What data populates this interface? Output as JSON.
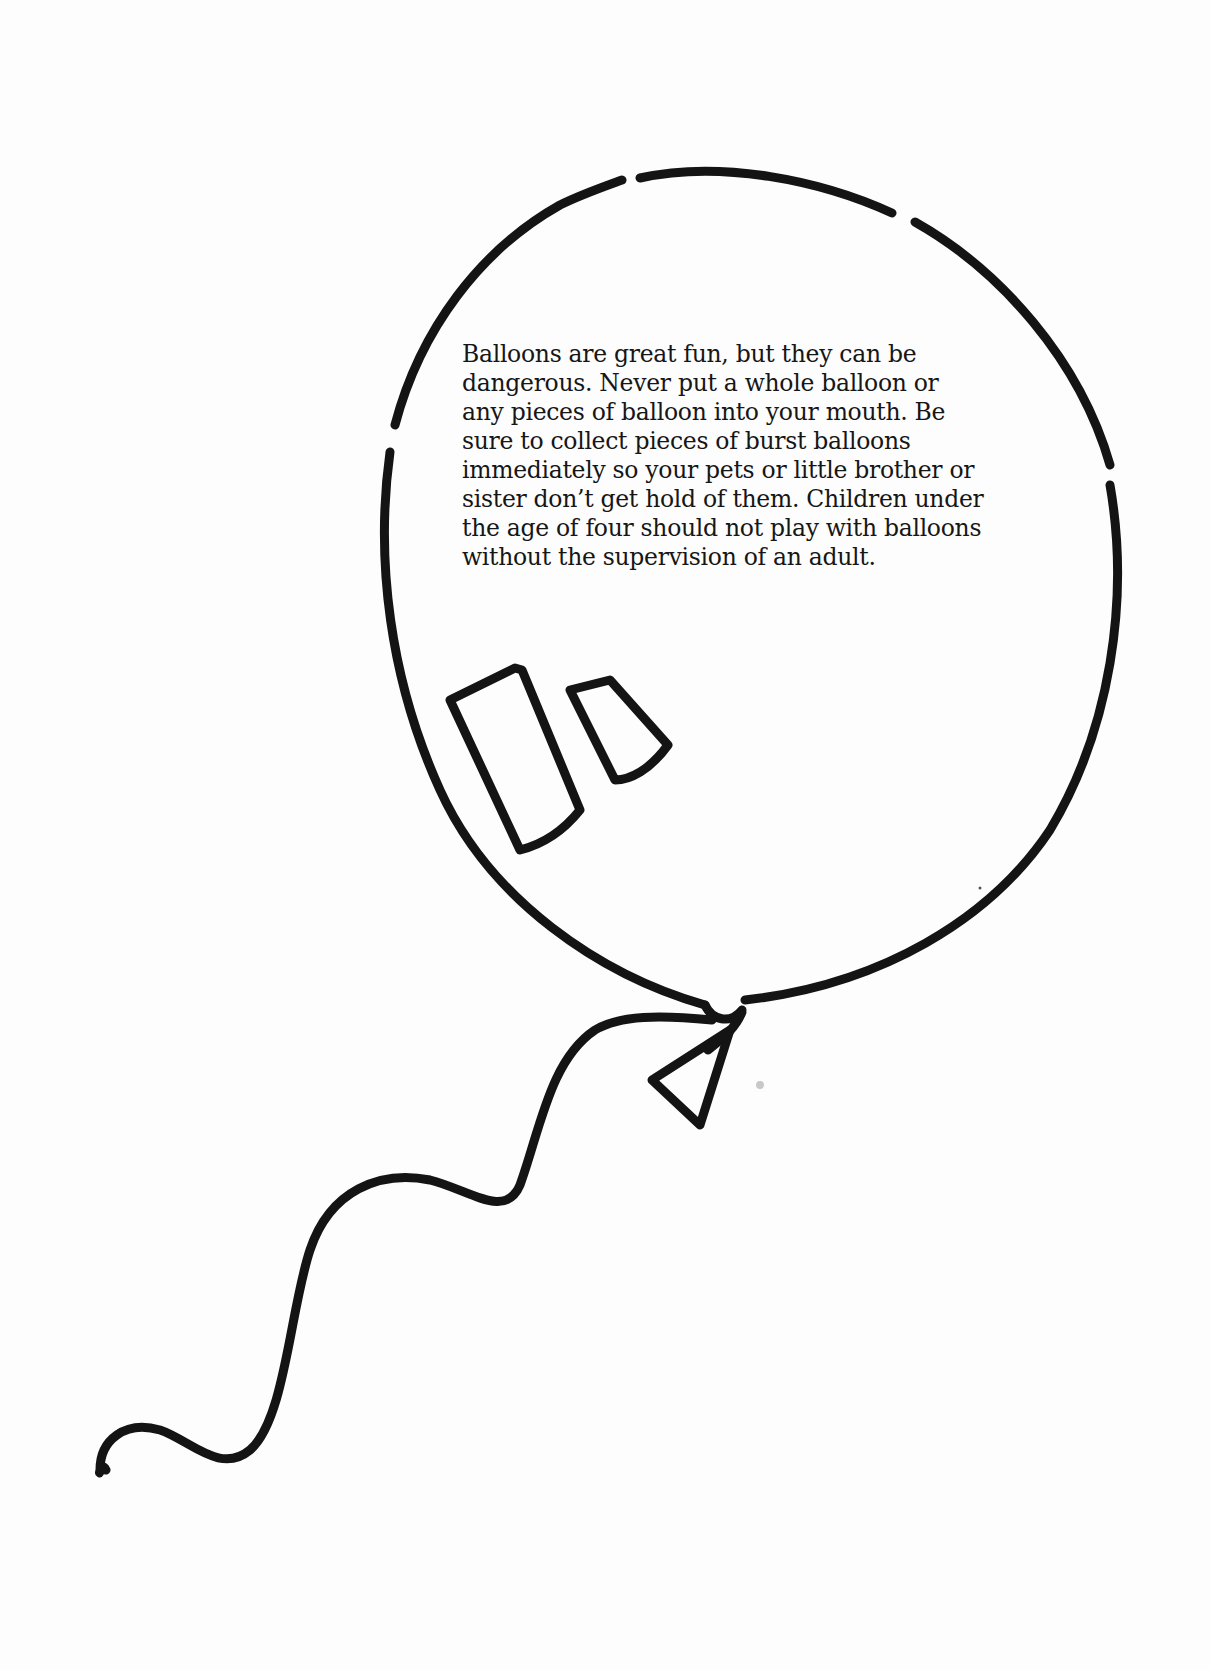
{
  "illustration": {
    "subject": "balloon",
    "stroke_color": "#141414",
    "background_color": "#fdfdfd"
  },
  "message": {
    "lines": [
      "Balloons are great fun, but they can be",
      "dangerous. Never put a whole balloon or",
      "any pieces of balloon into your mouth. Be",
      "sure to collect pieces of burst balloons",
      "immediately so your pets or little brother or",
      "sister don’t get hold of them. Children under",
      "the age of four should not play with balloons",
      "without the supervision of an adult."
    ]
  }
}
